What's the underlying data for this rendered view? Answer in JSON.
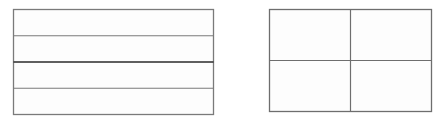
{
  "figures": [
    {
      "name": "rectangle-four-horizontal-strips",
      "description": "Rectangle divided into 4 equal horizontal strips",
      "rows": 4,
      "cols": 1,
      "line_color": "#7a7a7a",
      "emphasis_line_color": "#2a2a2a",
      "emphasized_divider_index": 2
    },
    {
      "name": "rectangle-four-quadrants",
      "description": "Rectangle divided into 4 equal quadrants",
      "rows": 2,
      "cols": 2,
      "line_color": "#6e6e6e"
    }
  ],
  "colors": {
    "background": "#ffffff",
    "fill": "#fdfdfd"
  }
}
